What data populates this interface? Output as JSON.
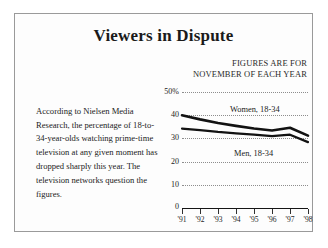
{
  "title": "Viewers in Dispute",
  "kicker": {
    "line1": "FIGURES ARE FOR",
    "line2": "NOVEMBER OF EACH YEAR"
  },
  "blurb": "According to Nielsen Media Research, the percentage of 18-to-34-year-olds watching prime-time television at any given moment has dropped sharply this year. The television networks question the figures.",
  "chart_data": {
    "type": "line",
    "title": "Viewers in Dispute",
    "subtitle": "FIGURES ARE FOR NOVEMBER OF EACH YEAR",
    "xlabel": "",
    "ylabel": "",
    "categories": [
      "'91",
      "'92",
      "'93",
      "'94",
      "'95",
      "'96",
      "'97",
      "'98"
    ],
    "ylim": [
      0,
      50
    ],
    "yticks": [
      0,
      10,
      20,
      30,
      40,
      50
    ],
    "ytick_labels": [
      "0",
      "10",
      "20",
      "30",
      "40",
      "50%"
    ],
    "grid": true,
    "legend_position": "inline-annotations",
    "series": [
      {
        "name": "Women, 18-34",
        "values": [
          40.0,
          38.2,
          36.6,
          35.4,
          34.3,
          33.4,
          34.6,
          31.2
        ]
      },
      {
        "name": "Men, 18-34",
        "values": [
          34.2,
          33.6,
          32.8,
          32.2,
          31.6,
          31.0,
          31.6,
          28.4
        ]
      }
    ]
  }
}
